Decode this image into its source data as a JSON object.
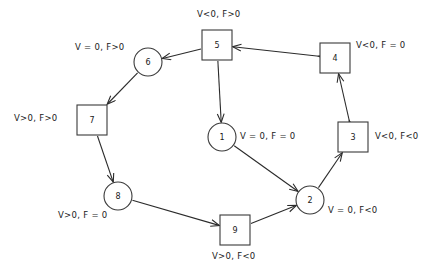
{
  "diagram": {
    "background": "#ffffff",
    "stroke_color": "#2b2b2b",
    "node_fill": "#ffffff",
    "nodes": [
      {
        "id": "1",
        "label": "1",
        "shape": "circle",
        "cx": 222,
        "cy": 137,
        "r": 14
      },
      {
        "id": "2",
        "label": "2",
        "shape": "circle",
        "cx": 310,
        "cy": 200,
        "r": 14
      },
      {
        "id": "3",
        "label": "3",
        "shape": "square",
        "cx": 353,
        "cy": 137,
        "size": 30
      },
      {
        "id": "4",
        "label": "4",
        "shape": "square",
        "cx": 335,
        "cy": 58,
        "size": 30
      },
      {
        "id": "5",
        "label": "5",
        "shape": "square",
        "cx": 217,
        "cy": 45,
        "size": 30
      },
      {
        "id": "6",
        "label": "6",
        "shape": "circle",
        "cx": 148,
        "cy": 62,
        "r": 14
      },
      {
        "id": "7",
        "label": "7",
        "shape": "square",
        "cx": 92,
        "cy": 120,
        "size": 30
      },
      {
        "id": "8",
        "label": "8",
        "shape": "circle",
        "cx": 118,
        "cy": 196,
        "r": 14
      },
      {
        "id": "9",
        "label": "9",
        "shape": "square",
        "cx": 235,
        "cy": 230,
        "size": 30
      }
    ],
    "node_labels": [
      {
        "for": "5",
        "text": "V<0, F>0",
        "x": 197,
        "y": 17,
        "anchor": "start"
      },
      {
        "for": "4",
        "text": "V<0, F = 0",
        "x": 356,
        "y": 48,
        "anchor": "start"
      },
      {
        "for": "6",
        "text": "V = 0, F>0",
        "x": 75,
        "y": 50,
        "anchor": "start"
      },
      {
        "for": "7",
        "text": "V>0, F>0",
        "x": 14,
        "y": 121,
        "anchor": "start"
      },
      {
        "for": "1",
        "text": "V = 0, F = 0",
        "x": 240,
        "y": 139,
        "anchor": "start"
      },
      {
        "for": "3",
        "text": "V<0, F<0",
        "x": 375,
        "y": 139,
        "anchor": "start"
      },
      {
        "for": "2",
        "text": "V = 0, F<0",
        "x": 328,
        "y": 213,
        "anchor": "start"
      },
      {
        "for": "8",
        "text": "V>0, F = 0",
        "x": 58,
        "y": 218,
        "anchor": "start"
      },
      {
        "for": "9",
        "text": "V>0, F<0",
        "x": 212,
        "y": 259,
        "anchor": "start"
      }
    ],
    "edges": [
      {
        "from": "5",
        "to": "6",
        "arrows": "single"
      },
      {
        "from": "6",
        "to": "7",
        "arrows": "single"
      },
      {
        "from": "7",
        "to": "8",
        "arrows": "single"
      },
      {
        "from": "8",
        "to": "9",
        "arrows": "single"
      },
      {
        "from": "9",
        "to": "2",
        "arrows": "single"
      },
      {
        "from": "2",
        "to": "3",
        "arrows": "single"
      },
      {
        "from": "3",
        "to": "4",
        "arrows": "double"
      },
      {
        "from": "4",
        "to": "5",
        "arrows": "double"
      },
      {
        "from": "5",
        "to": "1",
        "arrows": "single"
      },
      {
        "from": "1",
        "to": "2",
        "arrows": "single"
      }
    ]
  }
}
